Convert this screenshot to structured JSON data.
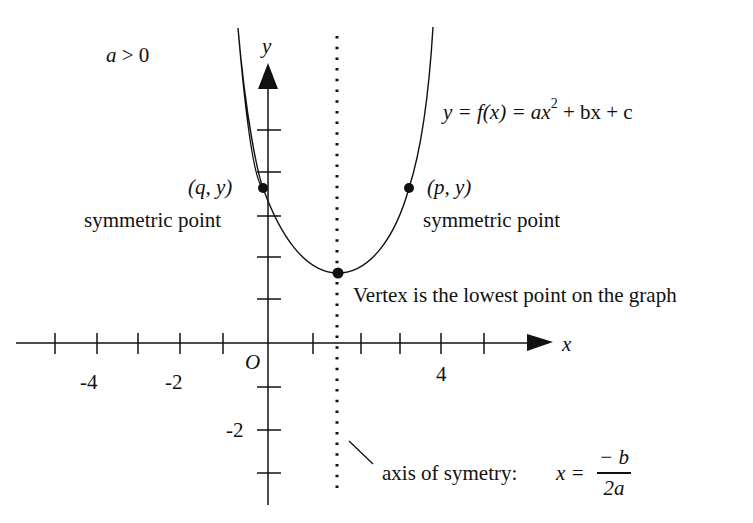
{
  "diagram": {
    "condition_label": "a > 0",
    "axes": {
      "x_label": "x",
      "y_label": "y",
      "origin_label": "O",
      "x_tick_labels": [
        "-4",
        "-2",
        "4"
      ],
      "y_tick_labels": [
        "-2"
      ]
    },
    "equation": {
      "lhs": "y = f(x) = ax",
      "exponent": "2",
      "rhs": " + bx + c"
    },
    "points": [
      {
        "name": "symmetric-point-left",
        "coord_label": "(q, y)",
        "caption": "symmetric point"
      },
      {
        "name": "symmetric-point-right",
        "coord_label": "(p, y)",
        "caption": "symmetric point"
      },
      {
        "name": "vertex",
        "caption": "Vertex is the lowest point on the graph"
      }
    ],
    "axis_of_symmetry": {
      "label": "axis of symetry:",
      "lhs": "x =",
      "numerator": "− b",
      "denominator": "2a"
    },
    "colors": {
      "stroke": "#111111",
      "background": "#ffffff"
    }
  }
}
